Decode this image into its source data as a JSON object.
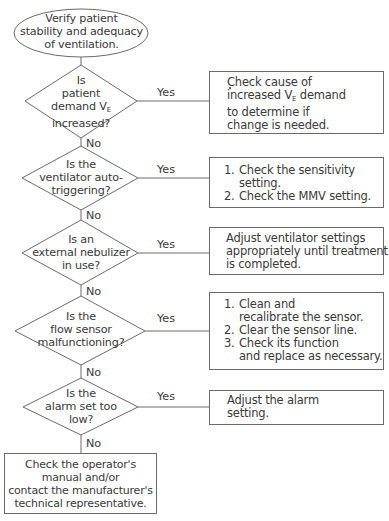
{
  "start": {
    "lines": [
      "Verify patient",
      "stability and adequacy",
      "of ventilation."
    ]
  },
  "decisions": [
    {
      "lines": [
        "Is",
        "patient",
        "demand V",
        "increased?"
      ],
      "subscript": "E",
      "yes_label": "Yes",
      "no_label": "No"
    },
    {
      "lines": [
        "Is the",
        "ventilator auto-",
        "triggering?"
      ],
      "yes_label": "Yes",
      "no_label": "No"
    },
    {
      "lines": [
        "Is an",
        "external nebulizer",
        "in use?"
      ],
      "yes_label": "Yes",
      "no_label": "No"
    },
    {
      "lines": [
        "Is the",
        "flow sensor",
        "malfunctioning?"
      ],
      "yes_label": "Yes",
      "no_label": "No"
    },
    {
      "lines": [
        "Is the",
        "alarm set too",
        "low?"
      ],
      "yes_label": "Yes",
      "no_label": "No"
    }
  ],
  "actions": [
    {
      "lines": [
        "Check cause of",
        "increased V",
        " demand",
        "to determine if",
        "change is needed."
      ],
      "subscript": "E"
    },
    {
      "items": [
        {
          "num": "1.",
          "lines": [
            "Check the sensitivity",
            "setting."
          ]
        },
        {
          "num": "2.",
          "lines": [
            "Check the MMV setting."
          ]
        }
      ]
    },
    {
      "lines": [
        "Adjust ventilator settings",
        "appropriately until treatment",
        "is completed."
      ]
    },
    {
      "items": [
        {
          "num": "1.",
          "lines": [
            "Clean and",
            "recalibrate the sensor."
          ]
        },
        {
          "num": "2.",
          "lines": [
            "Clear the sensor line."
          ]
        },
        {
          "num": "3.",
          "lines": [
            "Check its function",
            "and replace as necessary."
          ]
        }
      ]
    },
    {
      "lines": [
        "Adjust the alarm",
        "setting."
      ]
    }
  ],
  "end": {
    "lines": [
      "Check the operator's",
      "manual and/or",
      "contact the manufacturer's",
      "technical representative."
    ]
  },
  "colors": {
    "stroke": "#6a6a6a",
    "text": "#3a3a3a",
    "background": "#ffffff"
  }
}
